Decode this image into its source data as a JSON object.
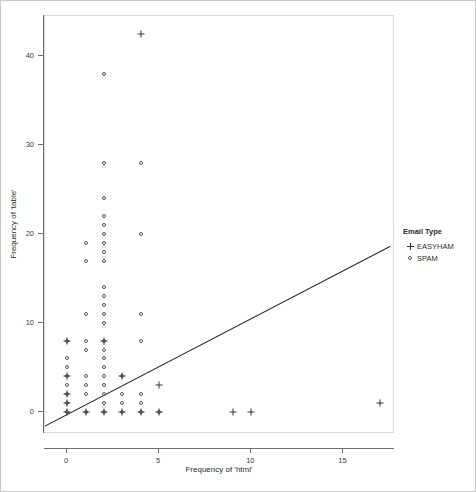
{
  "chart_data": {
    "type": "scatter",
    "title": "",
    "xlabel": "Frequency of 'html'",
    "ylabel": "Frequency of 'table'",
    "xlim": [
      -1.2,
      17.8
    ],
    "ylim": [
      -2.5,
      44.5
    ],
    "xticks": [
      0,
      5,
      10,
      15
    ],
    "xtick_labels": [
      "0",
      "5",
      "10",
      "15"
    ],
    "yticks": [
      0,
      10,
      20,
      30,
      40
    ],
    "ytick_labels": [
      "0",
      "10",
      "20",
      "30",
      "40"
    ],
    "grid": false,
    "legend": {
      "title": "Email Type",
      "position": "right",
      "entries": [
        {
          "label": "EASYHAM",
          "marker": "plus",
          "color": "#333333"
        },
        {
          "label": "SPAM",
          "marker": "open-circle",
          "color": "#555555"
        }
      ]
    },
    "fit_line": {
      "type": "linear-regression",
      "x_start": -1.2,
      "y_start": -1.6,
      "x_end": 17.55,
      "y_end": 18.6
    },
    "series": [
      {
        "name": "SPAM",
        "marker": "open-circle",
        "color": "#555555",
        "points": [
          [
            0,
            8
          ],
          [
            0,
            6
          ],
          [
            0,
            5
          ],
          [
            0,
            4
          ],
          [
            0,
            3
          ],
          [
            0,
            2
          ],
          [
            0,
            1
          ],
          [
            0,
            0
          ],
          [
            1,
            19
          ],
          [
            1,
            17
          ],
          [
            1,
            11
          ],
          [
            1,
            8
          ],
          [
            1,
            7
          ],
          [
            1,
            4
          ],
          [
            1,
            3
          ],
          [
            1,
            2
          ],
          [
            1,
            0
          ],
          [
            2,
            38
          ],
          [
            2,
            28
          ],
          [
            2,
            24
          ],
          [
            2,
            22
          ],
          [
            2,
            21
          ],
          [
            2,
            20
          ],
          [
            2,
            19
          ],
          [
            2,
            18
          ],
          [
            2,
            17
          ],
          [
            2,
            14
          ],
          [
            2,
            13
          ],
          [
            2,
            12
          ],
          [
            2,
            11
          ],
          [
            2,
            10
          ],
          [
            2,
            8
          ],
          [
            2,
            7
          ],
          [
            2,
            6
          ],
          [
            2,
            5
          ],
          [
            2,
            4
          ],
          [
            2,
            3
          ],
          [
            2,
            2
          ],
          [
            2,
            1
          ],
          [
            2,
            0
          ],
          [
            3,
            4
          ],
          [
            3,
            2
          ],
          [
            3,
            1
          ],
          [
            3,
            0
          ],
          [
            4,
            28
          ],
          [
            4,
            20
          ],
          [
            4,
            11
          ],
          [
            4,
            8
          ],
          [
            4,
            2
          ],
          [
            4,
            1
          ],
          [
            4,
            0
          ],
          [
            5,
            0
          ]
        ]
      },
      {
        "name": "EASYHAM",
        "marker": "plus",
        "color": "#333333",
        "points": [
          [
            4,
            42.5
          ],
          [
            0,
            8
          ],
          [
            0,
            4
          ],
          [
            0,
            2
          ],
          [
            0,
            1
          ],
          [
            0,
            0
          ],
          [
            1,
            0
          ],
          [
            2,
            8
          ],
          [
            2,
            0
          ],
          [
            3,
            4
          ],
          [
            3,
            0
          ],
          [
            4,
            0
          ],
          [
            5,
            3
          ],
          [
            5,
            0
          ],
          [
            9,
            0
          ],
          [
            10,
            0
          ],
          [
            17,
            1
          ]
        ]
      }
    ]
  },
  "axes": {
    "x_title": "Frequency of 'html'",
    "y_title": "Frequency of 'table'"
  },
  "legend": {
    "title": "Email Type",
    "easyham_label": "EASYHAM",
    "spam_label": "SPAM"
  }
}
